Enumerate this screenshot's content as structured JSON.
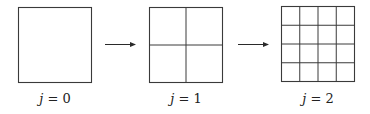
{
  "diagram": {
    "stages": [
      {
        "label_var": "j",
        "label_eq": " = ",
        "label_val": "0",
        "subdivisions": 1
      },
      {
        "label_var": "j",
        "label_eq": " = ",
        "label_val": "1",
        "subdivisions": 2
      },
      {
        "label_var": "j",
        "label_eq": " = ",
        "label_val": "2",
        "subdivisions": 4
      }
    ],
    "arrows": [
      {
        "from": "stage-0",
        "to": "stage-1"
      },
      {
        "from": "stage-1",
        "to": "stage-2"
      }
    ],
    "colors": {
      "line": "#3a3a3a",
      "background": "#ffffff"
    }
  }
}
